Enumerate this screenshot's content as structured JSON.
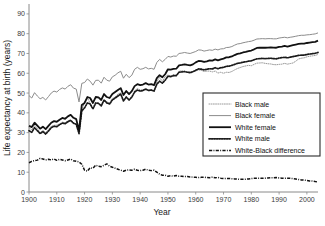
{
  "chart_data": {
    "type": "line",
    "title": "",
    "xlabel": "Year",
    "ylabel": "Life expectancy at birth (years)",
    "xlim": [
      1900,
      2004
    ],
    "ylim": [
      0,
      95
    ],
    "xticks": [
      1900,
      1910,
      1920,
      1930,
      1940,
      1950,
      1960,
      1970,
      1980,
      1990,
      2000
    ],
    "yticks": [
      0,
      10,
      20,
      30,
      40,
      50,
      60,
      70,
      80,
      90
    ],
    "grid": false,
    "legend_position": "center-right",
    "x": [
      1900,
      1901,
      1902,
      1903,
      1904,
      1905,
      1906,
      1907,
      1908,
      1909,
      1910,
      1911,
      1912,
      1913,
      1914,
      1915,
      1916,
      1917,
      1918,
      1919,
      1920,
      1921,
      1922,
      1923,
      1924,
      1925,
      1926,
      1927,
      1928,
      1929,
      1930,
      1931,
      1932,
      1933,
      1934,
      1935,
      1936,
      1937,
      1938,
      1939,
      1940,
      1941,
      1942,
      1943,
      1944,
      1945,
      1946,
      1947,
      1948,
      1949,
      1950,
      1951,
      1952,
      1953,
      1954,
      1955,
      1956,
      1957,
      1958,
      1959,
      1960,
      1961,
      1962,
      1963,
      1964,
      1965,
      1966,
      1967,
      1968,
      1969,
      1970,
      1971,
      1972,
      1973,
      1974,
      1975,
      1976,
      1977,
      1978,
      1979,
      1980,
      1981,
      1982,
      1983,
      1984,
      1985,
      1986,
      1987,
      1988,
      1989,
      1990,
      1991,
      1992,
      1993,
      1994,
      1995,
      1996,
      1997,
      1998,
      1999,
      2000,
      2001,
      2002,
      2003,
      2004
    ],
    "series": [
      {
        "name": "Black male",
        "style": "fine-dotted",
        "color": "#9a9a9a",
        "values": [
          32.5,
          31.4,
          33.8,
          32.1,
          30.0,
          31.2,
          30.0,
          31.6,
          33.2,
          33.7,
          33.8,
          34.4,
          35.3,
          35.0,
          36.0,
          36.5,
          35.0,
          34.3,
          29.9,
          40.9,
          45.5,
          47.7,
          44.8,
          41.8,
          44.5,
          44.9,
          43.7,
          46.8,
          45.6,
          45.0,
          47.3,
          47.9,
          49.5,
          50.1,
          46.5,
          48.0,
          46.3,
          47.5,
          51.1,
          52.3,
          51.5,
          51.6,
          52.3,
          51.5,
          51.8,
          51.1,
          55.8,
          57.9,
          55.9,
          58.3,
          59.1,
          58.6,
          59.3,
          58.9,
          61.0,
          61.2,
          61.1,
          60.7,
          60.6,
          61.0,
          61.1,
          61.7,
          61.5,
          60.9,
          61.1,
          61.1,
          60.7,
          61.1,
          60.1,
          60.5,
          60.0,
          60.5,
          60.4,
          60.9,
          61.7,
          62.4,
          62.9,
          63.4,
          63.7,
          64.0,
          63.8,
          64.5,
          65.1,
          65.2,
          65.3,
          65.0,
          64.8,
          64.7,
          64.4,
          64.3,
          64.5,
          64.6,
          65.0,
          64.6,
          64.9,
          65.2,
          66.1,
          67.2,
          67.6,
          67.8,
          68.3,
          68.6,
          68.8,
          69.0,
          69.5
        ]
      },
      {
        "name": "Black female",
        "style": "thin-solid",
        "color": "#8c8c8c",
        "values": [
          48.7,
          47.5,
          50.2,
          48.5,
          47.1,
          47.8,
          46.5,
          48.2,
          50.0,
          51.0,
          50.5,
          51.8,
          52.6,
          52.0,
          53.4,
          54.2,
          52.5,
          52.0,
          45.5,
          54.9,
          55.3,
          57.1,
          56.0,
          54.0,
          56.4,
          56.5,
          55.0,
          58.0,
          56.5,
          56.0,
          58.2,
          59.0,
          60.2,
          61.0,
          57.5,
          59.5,
          57.8,
          59.0,
          62.0,
          63.0,
          62.0,
          62.3,
          63.0,
          62.2,
          62.5,
          62.0,
          65.5,
          67.0,
          65.8,
          67.0,
          68.5,
          68.2,
          68.7,
          68.6,
          70.0,
          70.2,
          70.5,
          70.2,
          70.0,
          70.5,
          71.0,
          71.8,
          71.7,
          71.2,
          71.5,
          71.8,
          71.6,
          72.2,
          71.8,
          72.3,
          72.4,
          73.0,
          73.1,
          73.5,
          74.2,
          74.8,
          75.0,
          75.4,
          75.7,
          76.0,
          76.2,
          76.7,
          77.3,
          77.4,
          77.5,
          77.4,
          77.5,
          77.5,
          77.4,
          77.4,
          77.8,
          78.0,
          78.2,
          77.9,
          78.2,
          78.4,
          78.7,
          79.0,
          79.2,
          79.2,
          79.4,
          79.5,
          79.7,
          79.9,
          80.4
        ]
      },
      {
        "name": "White female",
        "style": "thick-solid",
        "color": "#111111",
        "values": [
          33.5,
          32.8,
          35.0,
          33.5,
          32.0,
          33.0,
          31.8,
          33.4,
          35.0,
          35.8,
          35.5,
          36.5,
          37.4,
          37.0,
          38.2,
          39.0,
          37.5,
          36.8,
          31.0,
          44.0,
          45.0,
          48.0,
          47.5,
          45.0,
          48.0,
          47.8,
          46.5,
          49.5,
          48.0,
          47.5,
          49.5,
          50.5,
          51.5,
          52.5,
          49.0,
          51.0,
          49.5,
          51.0,
          53.5,
          54.5,
          54.0,
          54.3,
          55.0,
          54.3,
          54.5,
          54.0,
          57.5,
          59.0,
          58.0,
          59.5,
          62.0,
          61.8,
          62.2,
          62.3,
          64.0,
          64.2,
          64.5,
          64.2,
          64.0,
          64.5,
          65.5,
          66.2,
          66.1,
          65.7,
          66.0,
          66.5,
          66.4,
          67.0,
          66.5,
          67.0,
          67.4,
          68.0,
          68.1,
          68.5,
          69.2,
          69.8,
          70.0,
          70.5,
          70.8,
          71.2,
          71.5,
          72.1,
          72.8,
          72.9,
          73.0,
          72.9,
          73.0,
          73.1,
          73.0,
          72.9,
          73.3,
          73.5,
          73.8,
          73.5,
          73.9,
          74.2,
          74.5,
          74.8,
          75.0,
          75.0,
          75.3,
          75.5,
          75.7,
          75.9,
          76.5
        ]
      },
      {
        "name": "White male",
        "style": "thick-dotted",
        "color": "#1a1a1a",
        "values": [
          31.0,
          30.2,
          32.5,
          31.0,
          29.5,
          30.5,
          29.3,
          30.8,
          32.5,
          33.2,
          33.0,
          34.0,
          34.8,
          34.5,
          35.5,
          36.2,
          34.8,
          34.2,
          29.5,
          41.0,
          42.5,
          45.0,
          44.5,
          42.0,
          45.0,
          44.8,
          43.5,
          46.5,
          45.0,
          44.5,
          46.5,
          47.5,
          48.5,
          49.5,
          46.0,
          48.0,
          46.5,
          48.0,
          50.5,
          51.5,
          51.0,
          51.3,
          52.0,
          51.3,
          51.5,
          51.0,
          54.5,
          56.0,
          55.0,
          56.5,
          58.5,
          58.3,
          58.8,
          58.8,
          60.5,
          60.7,
          60.8,
          60.5,
          60.3,
          60.8,
          61.5,
          62.2,
          62.1,
          61.7,
          62.0,
          62.3,
          62.2,
          62.8,
          62.3,
          62.8,
          63.0,
          63.5,
          63.6,
          64.0,
          64.5,
          65.0,
          65.2,
          65.6,
          65.8,
          66.1,
          66.3,
          66.8,
          67.3,
          67.4,
          67.5,
          67.4,
          67.5,
          67.6,
          67.4,
          67.3,
          67.7,
          67.9,
          68.1,
          67.8,
          68.1,
          68.4,
          68.7,
          69.0,
          69.2,
          69.2,
          69.5,
          69.7,
          69.9,
          70.1,
          70.5
        ]
      },
      {
        "name": "White-Black difference",
        "style": "dash-dot",
        "color": "#111111",
        "values": [
          14.8,
          15.5,
          15.8,
          16.1,
          17.0,
          16.7,
          16.2,
          16.5,
          16.2,
          16.7,
          16.0,
          16.5,
          16.2,
          15.8,
          16.2,
          16.6,
          15.8,
          15.5,
          15.2,
          14.0,
          11.0,
          10.5,
          12.2,
          12.0,
          13.5,
          13.0,
          12.8,
          13.5,
          14.2,
          13.0,
          12.5,
          12.0,
          11.5,
          11.0,
          10.5,
          11.0,
          11.2,
          11.0,
          11.5,
          11.0,
          10.8,
          11.0,
          11.5,
          11.0,
          10.8,
          11.0,
          10.0,
          9.0,
          8.5,
          8.5,
          8.0,
          8.2,
          8.0,
          8.3,
          8.0,
          8.0,
          7.8,
          7.8,
          7.6,
          7.5,
          7.4,
          7.3,
          7.4,
          7.5,
          7.3,
          7.2,
          7.5,
          7.2,
          7.3,
          7.0,
          6.8,
          6.9,
          6.8,
          6.7,
          6.6,
          6.5,
          6.4,
          6.4,
          6.5,
          6.6,
          6.8,
          6.9,
          7.0,
          7.0,
          6.9,
          7.0,
          7.1,
          7.2,
          7.2,
          7.3,
          7.1,
          7.0,
          6.9,
          7.0,
          6.9,
          6.8,
          6.6,
          6.3,
          6.1,
          6.0,
          5.8,
          5.6,
          5.5,
          5.3,
          5.2
        ]
      }
    ]
  },
  "axis": {
    "xlabel": "Year",
    "ylabel": "Life expectancy at birth (years)",
    "xticks": [
      "1900",
      "1910",
      "1920",
      "1930",
      "1940",
      "1950",
      "1960",
      "1970",
      "1980",
      "1990",
      "2000"
    ],
    "yticks": [
      "0",
      "10",
      "20",
      "30",
      "40",
      "50",
      "60",
      "70",
      "80",
      "90"
    ]
  },
  "legend": {
    "items": [
      {
        "label": "Black male"
      },
      {
        "label": "Black female"
      },
      {
        "label": "White female"
      },
      {
        "label": "White male"
      },
      {
        "label": "White-Black difference"
      }
    ]
  },
  "colors": {
    "black_series": "#111111",
    "gray_series": "#9a9a9a",
    "axis": "#8a8a8a",
    "background": "#ffffff"
  }
}
